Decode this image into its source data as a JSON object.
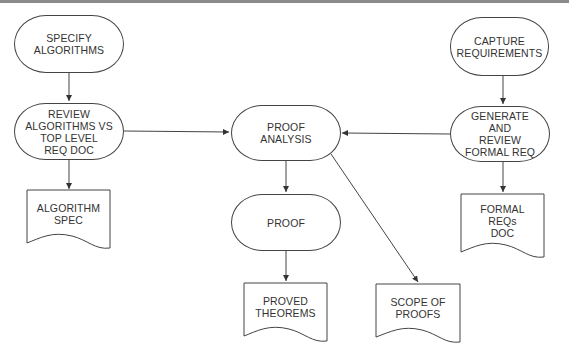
{
  "diagram": {
    "type": "flowchart",
    "colors": {
      "stroke": "#444444",
      "text": "#333333",
      "background": "#ffffff",
      "top_rule": "#8a8a8a"
    },
    "nodes": {
      "specify_algorithms": {
        "shape": "terminator",
        "label": "SPECIFY\nALGORITHMS"
      },
      "review_algorithms": {
        "shape": "terminator",
        "label": "REVIEW\nALGORITHMS VS\nTOP LEVEL\nREQ DOC"
      },
      "algorithm_spec": {
        "shape": "document",
        "label": "ALGORITHM\nSPEC"
      },
      "proof_analysis": {
        "shape": "terminator",
        "label": "PROOF\nANALYSIS"
      },
      "proof": {
        "shape": "terminator",
        "label": "PROOF"
      },
      "proved_theorems": {
        "shape": "document",
        "label": "PROVED\nTHEOREMS"
      },
      "scope_of_proofs": {
        "shape": "document",
        "label": "SCOPE OF\nPROOFS"
      },
      "capture_requirements": {
        "shape": "terminator",
        "label": "CAPTURE\nREQUIREMENTS"
      },
      "generate_review_formal_req": {
        "shape": "terminator",
        "label": "GENERATE\nAND\nREVIEW\nFORMAL REQ"
      },
      "formal_reqs_doc": {
        "shape": "document",
        "label": "FORMAL\nREQs\nDOC"
      }
    },
    "edges": [
      {
        "from": "SPECIFY ALGORITHMS",
        "to": "REVIEW ALGORITHMS VS TOP LEVEL REQ DOC"
      },
      {
        "from": "REVIEW ALGORITHMS VS TOP LEVEL REQ DOC",
        "to": "ALGORITHM SPEC"
      },
      {
        "from": "REVIEW ALGORITHMS VS TOP LEVEL REQ DOC",
        "to": "PROOF ANALYSIS"
      },
      {
        "from": "CAPTURE REQUIREMENTS",
        "to": "GENERATE AND REVIEW FORMAL REQ"
      },
      {
        "from": "GENERATE AND REVIEW FORMAL REQ",
        "to": "PROOF ANALYSIS"
      },
      {
        "from": "GENERATE AND REVIEW FORMAL REQ",
        "to": "FORMAL REQs DOC"
      },
      {
        "from": "PROOF ANALYSIS",
        "to": "PROOF"
      },
      {
        "from": "PROOF ANALYSIS",
        "to": "SCOPE OF PROOFS"
      },
      {
        "from": "PROOF",
        "to": "PROVED THEOREMS"
      }
    ]
  }
}
